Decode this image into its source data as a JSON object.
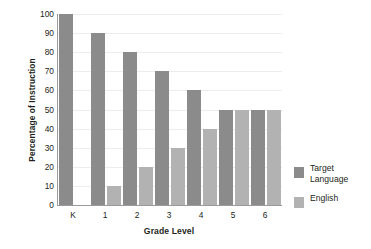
{
  "chart_data": {
    "type": "bar",
    "title": "",
    "xlabel": "Grade Level",
    "ylabel": "Percentage of Instruction",
    "categories": [
      "K",
      "1",
      "2",
      "3",
      "4",
      "5",
      "6"
    ],
    "series": [
      {
        "name": "Target Language",
        "color": "#8b8b8b",
        "values": [
          100,
          90,
          80,
          70,
          60,
          50,
          50
        ]
      },
      {
        "name": "English",
        "color": "#b2b2b2",
        "values": [
          0,
          10,
          20,
          30,
          40,
          50,
          50
        ]
      }
    ],
    "ylim": [
      0,
      100
    ],
    "y_ticks": [
      "100",
      "90",
      "80",
      "70",
      "60",
      "50",
      "40",
      "30",
      "20",
      "10",
      "0"
    ],
    "y_tick_values": [
      100,
      90,
      80,
      70,
      60,
      50,
      40,
      30,
      20,
      10,
      0
    ],
    "grid": true,
    "grid_axis": "y",
    "legend_position": "right",
    "legend": [
      {
        "label": "Target\nLanguage",
        "color": "#8b8b8b"
      },
      {
        "label": "English",
        "color": "#b2b2b2"
      }
    ]
  },
  "colors": {
    "target_language": "#8b8b8b",
    "english": "#b2b2b2",
    "axis": "#9a9a9a",
    "gridline": "#ededed",
    "text": "#231f20",
    "background": "#ffffff"
  }
}
